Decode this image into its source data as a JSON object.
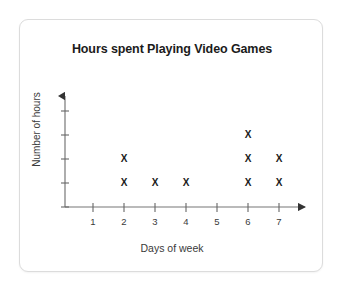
{
  "card": {
    "background_color": "#ffffff",
    "border_color": "#dcdcdc"
  },
  "chart_data": {
    "type": "scatter",
    "plot_style": "dot-plot",
    "title": "Hours spent Playing Video Games",
    "xlabel": "Days of week",
    "ylabel": "Number of hours",
    "categories": [
      "1",
      "2",
      "3",
      "4",
      "5",
      "6",
      "7"
    ],
    "x": [
      1,
      2,
      3,
      4,
      5,
      6,
      7
    ],
    "values": [
      0,
      2,
      1,
      1,
      0,
      3,
      2
    ],
    "marker": "X",
    "marker_color": "#1b1b1b",
    "xlim": [
      0,
      8
    ],
    "ylim": [
      0,
      5
    ],
    "x_tick_labels": [
      "1",
      "2",
      "3",
      "4",
      "5",
      "6",
      "7"
    ],
    "y_tick_labels": [
      "",
      "",
      "",
      "",
      ""
    ],
    "y_tick_count": 5,
    "grid": false,
    "legend": null,
    "axis_color": "#555555",
    "axis_arrows": true,
    "points": [
      {
        "day": 2,
        "count": 2,
        "levels": [
          1,
          2
        ]
      },
      {
        "day": 3,
        "count": 1,
        "levels": [
          1
        ]
      },
      {
        "day": 4,
        "count": 1,
        "levels": [
          1
        ]
      },
      {
        "day": 6,
        "count": 3,
        "levels": [
          1,
          2,
          3
        ]
      },
      {
        "day": 7,
        "count": 2,
        "levels": [
          1,
          2
        ]
      }
    ]
  }
}
